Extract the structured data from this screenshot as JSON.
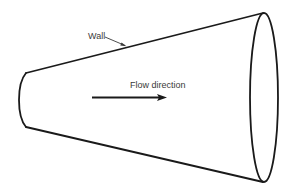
{
  "diagram": {
    "labels": {
      "wall": "Wall",
      "flow_direction": "Flow direction"
    },
    "colors": {
      "stroke": "#1a1a1a",
      "text": "#3a3a3a",
      "background": "#ffffff"
    },
    "shapes": {
      "inlet_end": {
        "x": 26,
        "top_y": 73,
        "bottom_y": 127,
        "bulge_x": 19
      },
      "outlet_ellipse": {
        "cx": 264,
        "cy": 97.5,
        "rx": 14,
        "ry": 84.5
      },
      "top_wall": {
        "x1": 26,
        "y1": 73,
        "x2": 263,
        "y2": 13
      },
      "bottom_wall": {
        "x1": 26,
        "y1": 127,
        "x2": 263,
        "y2": 182
      },
      "wall_leader": {
        "x1": 105,
        "y1": 37,
        "x2": 126,
        "y2": 46
      },
      "flow_arrow": {
        "x1": 92,
        "y1": 97.5,
        "x2": 166,
        "y2": 97.5
      }
    }
  }
}
